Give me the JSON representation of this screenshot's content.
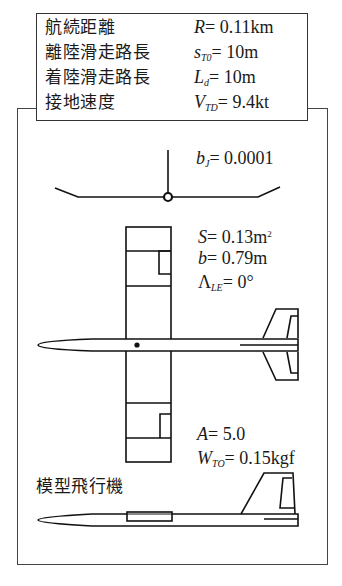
{
  "specs": [
    {
      "label": "航続距離",
      "symbol": "R",
      "sub": "",
      "value": "= 0.11km"
    },
    {
      "label": "離陸滑走路長",
      "symbol": "s",
      "sub": "T0",
      "value": "= 10m"
    },
    {
      "label": "着陸滑走路長",
      "symbol": "L",
      "sub": "d",
      "value": "= 10m"
    },
    {
      "label": "接地速度",
      "symbol": "V",
      "sub": "TD",
      "value": "= 9.4kt"
    }
  ],
  "params": {
    "bj": {
      "symbol": "b",
      "sub": "J",
      "value": "= 0.0001"
    },
    "S": {
      "symbol": "S",
      "value": "= 0.13m",
      "sup": "2"
    },
    "b": {
      "symbol": "b",
      "value": "= 0.79m"
    },
    "lambda": {
      "symbol": "Λ",
      "sub": "LE",
      "value": "= 0°"
    },
    "A": {
      "symbol": "A",
      "value": "= 5.0"
    },
    "W": {
      "symbol": "W",
      "sub": "TO",
      "value": "= 0.15kgf"
    }
  },
  "model_label": "模型飛行機"
}
